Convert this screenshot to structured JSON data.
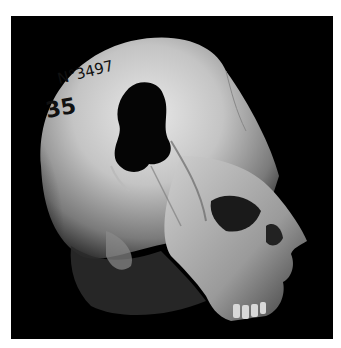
{
  "image": {
    "subject": "Human skull, side view, with cranial perforation",
    "background_color": "#000000",
    "frame_color": "#ffffff",
    "bone_colors": [
      "#e6e6e6",
      "#bdbdbd",
      "#8a8a8a",
      "#4a4a4a"
    ],
    "inscriptions": {
      "catalog_number": "N°3497",
      "secondary_number": "35"
    }
  }
}
